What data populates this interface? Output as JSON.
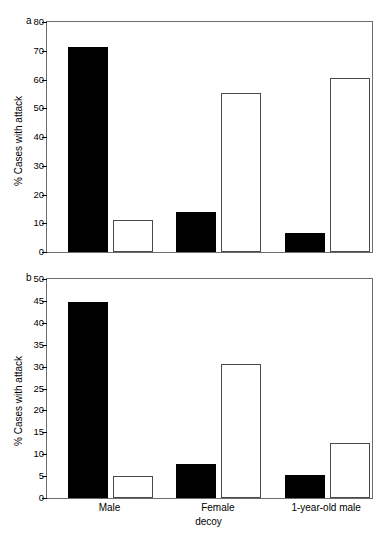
{
  "figure": {
    "width": 380,
    "height": 544,
    "background": "#ffffff",
    "bar_filled_color": "#000000",
    "bar_open_color": "#ffffff",
    "bar_open_edge_color": "#4a4a4a",
    "axis_color": "#6d6d6d"
  },
  "chart_data": [
    {
      "type": "bar",
      "panel": "a",
      "panel_label": "a",
      "title": "",
      "xlabel": "",
      "ylabel": "% Cases with attack",
      "categories": [
        "Male",
        "Female",
        "1-year-old male"
      ],
      "ylim": [
        0,
        80
      ],
      "yticks": [
        0,
        10,
        20,
        30,
        40,
        50,
        60,
        70,
        80
      ],
      "ytick_labels": [
        "0",
        "10",
        "20",
        "30",
        "40",
        "50",
        "60",
        "70",
        "80"
      ],
      "grid": false,
      "legend": "none",
      "series": [
        {
          "name": "filled",
          "style": "filled-black",
          "values": [
            71.3,
            13.8,
            6.6
          ]
        },
        {
          "name": "open",
          "style": "open-white",
          "values": [
            11.1,
            55.4,
            60.6
          ]
        }
      ]
    },
    {
      "type": "bar",
      "panel": "b",
      "panel_label": "b",
      "title": "",
      "xlabel": "decoy",
      "ylabel": "% Cases with attack",
      "categories": [
        "Male",
        "Female",
        "1-year-old male"
      ],
      "ylim": [
        0,
        50
      ],
      "yticks": [
        0,
        5,
        10,
        15,
        20,
        25,
        30,
        35,
        40,
        45,
        50
      ],
      "ytick_labels": [
        "0",
        "5",
        "10",
        "15",
        "20",
        "25",
        "30",
        "35",
        "40",
        "45",
        "50"
      ],
      "grid": false,
      "legend": "none",
      "series": [
        {
          "name": "filled",
          "style": "filled-black",
          "values": [
            44.8,
            7.7,
            5.3
          ]
        },
        {
          "name": "open",
          "style": "open-white",
          "values": [
            5.0,
            30.5,
            12.5
          ]
        }
      ]
    }
  ]
}
